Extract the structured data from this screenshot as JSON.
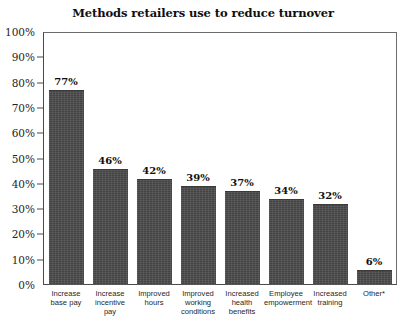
{
  "chart_data": {
    "type": "bar",
    "title": "Methods retailers use to reduce turnover",
    "xlabel": "",
    "ylabel": "",
    "ylim": [
      0,
      100
    ],
    "ytick_labels": [
      "0%",
      "10%",
      "20%",
      "30%",
      "40%",
      "50%",
      "60%",
      "70%",
      "80%",
      "90%",
      "100%"
    ],
    "ytick_values": [
      0,
      10,
      20,
      30,
      40,
      50,
      60,
      70,
      80,
      90,
      100
    ],
    "grid": false,
    "legend": null,
    "bar_color": "#4b4b4b",
    "categories": [
      "Increase base pay",
      "Increase incentive pay",
      "Improved hours",
      "Improved working conditions",
      "Increased health benefits",
      "Employee empowerment",
      "Increased training",
      "Other*"
    ],
    "values": [
      77,
      46,
      42,
      39,
      37,
      34,
      32,
      6
    ],
    "data_labels": [
      "77%",
      "46%",
      "42%",
      "39%",
      "37%",
      "34%",
      "32%",
      "6%"
    ]
  }
}
